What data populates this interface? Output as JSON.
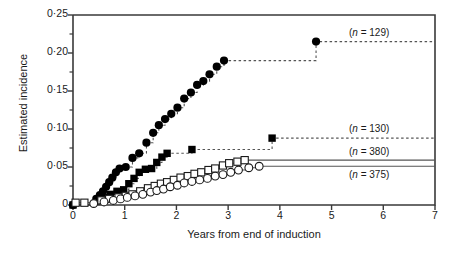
{
  "figure": {
    "axes": {
      "x_title": "Years from end of induction",
      "y_title": "Estimated incidence",
      "x_ticks": [
        "0",
        "1",
        "2",
        "3",
        "4",
        "5",
        "6",
        "7"
      ],
      "y_ticks": [
        "0",
        "0·05",
        "0·10",
        "0·15",
        "0·20",
        "0·25"
      ]
    },
    "legend": {
      "filled_circle": "(n = 129)",
      "filled_square": "(n = 130)",
      "open_square": "(n = 380)",
      "open_circle": "(n = 375)"
    }
  },
  "chart_data": {
    "type": "line",
    "title": "",
    "xlabel": "Years from end of induction",
    "ylabel": "Estimated incidence",
    "xlim": [
      0,
      7
    ],
    "ylim": [
      0,
      0.25
    ],
    "xticks": [
      0,
      1,
      2,
      3,
      4,
      5,
      6,
      7
    ],
    "yticks": [
      0,
      0.05,
      0.1,
      0.15,
      0.2,
      0.25
    ],
    "minor_y_tick_step": 0.025,
    "grid": false,
    "legend_position": "inline-right",
    "step_style": "kaplan-meier-step",
    "series": [
      {
        "name": "(n = 129)",
        "label": "(n = 129)",
        "n": 129,
        "marker": "filled-circle",
        "color": "#000000",
        "line": "dashed",
        "points": [
          [
            0.0,
            0.0
          ],
          [
            0.45,
            0.008
          ],
          [
            0.52,
            0.013
          ],
          [
            0.58,
            0.018
          ],
          [
            0.64,
            0.024
          ],
          [
            0.7,
            0.03
          ],
          [
            0.76,
            0.036
          ],
          [
            0.83,
            0.043
          ],
          [
            0.9,
            0.048
          ],
          [
            1.02,
            0.05
          ],
          [
            1.15,
            0.062
          ],
          [
            1.28,
            0.068
          ],
          [
            1.42,
            0.082
          ],
          [
            1.55,
            0.095
          ],
          [
            1.66,
            0.105
          ],
          [
            1.78,
            0.113
          ],
          [
            1.9,
            0.12
          ],
          [
            2.02,
            0.128
          ],
          [
            2.15,
            0.14
          ],
          [
            2.28,
            0.148
          ],
          [
            2.4,
            0.158
          ],
          [
            2.52,
            0.163
          ],
          [
            2.64,
            0.172
          ],
          [
            2.78,
            0.182
          ],
          [
            2.92,
            0.19
          ],
          [
            4.7,
            0.215
          ],
          [
            7.0,
            0.215
          ]
        ]
      },
      {
        "name": "(n = 130)",
        "label": "(n = 130)",
        "n": 130,
        "marker": "filled-square",
        "color": "#000000",
        "line": "dashed",
        "points": [
          [
            0.0,
            0.0
          ],
          [
            0.5,
            0.006
          ],
          [
            0.6,
            0.01
          ],
          [
            0.72,
            0.014
          ],
          [
            0.85,
            0.018
          ],
          [
            0.98,
            0.02
          ],
          [
            1.08,
            0.028
          ],
          [
            1.18,
            0.035
          ],
          [
            1.28,
            0.043
          ],
          [
            1.4,
            0.047
          ],
          [
            1.52,
            0.048
          ],
          [
            1.62,
            0.056
          ],
          [
            1.72,
            0.063
          ],
          [
            1.82,
            0.068
          ],
          [
            2.3,
            0.073
          ],
          [
            3.85,
            0.088
          ],
          [
            7.0,
            0.088
          ]
        ]
      },
      {
        "name": "(n = 380)",
        "label": "(n = 380)",
        "n": 380,
        "marker": "open-square",
        "color": "#000000",
        "line": "solid",
        "points": [
          [
            0.05,
            0.003
          ],
          [
            0.22,
            0.003
          ],
          [
            0.55,
            0.006
          ],
          [
            0.7,
            0.008
          ],
          [
            0.88,
            0.01
          ],
          [
            1.02,
            0.012
          ],
          [
            1.15,
            0.014
          ],
          [
            1.3,
            0.018
          ],
          [
            1.45,
            0.022
          ],
          [
            1.58,
            0.025
          ],
          [
            1.7,
            0.028
          ],
          [
            1.82,
            0.03
          ],
          [
            1.95,
            0.033
          ],
          [
            2.08,
            0.036
          ],
          [
            2.22,
            0.038
          ],
          [
            2.35,
            0.041
          ],
          [
            2.48,
            0.043
          ],
          [
            2.62,
            0.046
          ],
          [
            2.75,
            0.048
          ],
          [
            2.9,
            0.052
          ],
          [
            3.02,
            0.055
          ],
          [
            3.18,
            0.057
          ],
          [
            3.32,
            0.059
          ],
          [
            7.0,
            0.059
          ]
        ]
      },
      {
        "name": "(n = 375)",
        "label": "(n = 375)",
        "n": 375,
        "marker": "open-circle",
        "color": "#000000",
        "line": "solid",
        "points": [
          [
            0.4,
            0.002
          ],
          [
            0.6,
            0.004
          ],
          [
            0.78,
            0.006
          ],
          [
            0.92,
            0.008
          ],
          [
            1.05,
            0.01
          ],
          [
            1.2,
            0.012
          ],
          [
            1.35,
            0.014
          ],
          [
            1.5,
            0.017
          ],
          [
            1.62,
            0.019
          ],
          [
            1.75,
            0.021
          ],
          [
            1.88,
            0.024
          ],
          [
            2.02,
            0.026
          ],
          [
            2.15,
            0.029
          ],
          [
            2.3,
            0.031
          ],
          [
            2.45,
            0.033
          ],
          [
            2.6,
            0.035
          ],
          [
            2.75,
            0.038
          ],
          [
            2.9,
            0.04
          ],
          [
            3.05,
            0.043
          ],
          [
            3.2,
            0.046
          ],
          [
            3.4,
            0.049
          ],
          [
            3.6,
            0.051
          ],
          [
            7.0,
            0.051
          ]
        ]
      }
    ]
  }
}
